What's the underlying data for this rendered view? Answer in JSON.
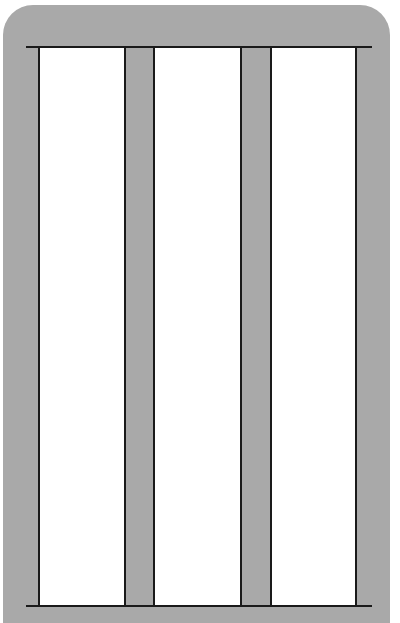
{
  "diagram": {
    "type": "frame-elevation",
    "colors": {
      "frame": "#a9a9a9",
      "panel": "#ffffff",
      "line": "#1a1a1a",
      "background": "#ffffff"
    },
    "panels": [
      {
        "name": "left-panel"
      },
      {
        "name": "center-panel"
      },
      {
        "name": "right-panel"
      }
    ],
    "mullions": 2
  }
}
